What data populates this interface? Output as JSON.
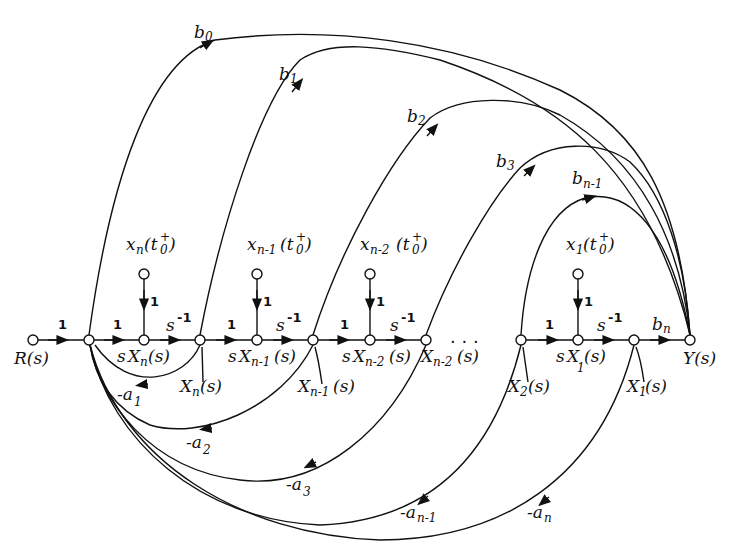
{
  "diagram": {
    "type": "signal-flow-graph",
    "input_label": "R(s)",
    "output_label": "Y(s)",
    "forward_path": {
      "input_gain": "1",
      "nodes": [
        {
          "id": "R",
          "label": "R(s)"
        },
        {
          "id": "N1",
          "label": ""
        },
        {
          "id": "sXn",
          "label": "sX_n(s)"
        },
        {
          "id": "Xn",
          "label": "X_n(s)"
        },
        {
          "id": "sXn1",
          "label": "sX_{n-1}(s)"
        },
        {
          "id": "Xn1",
          "label": "X_{n-1}(s)"
        },
        {
          "id": "sXn2",
          "label": "sX_{n-2}(s)"
        },
        {
          "id": "Xn2",
          "label": "X_{n-2}(s)"
        },
        {
          "id": "X2",
          "label": "X_2(s)"
        },
        {
          "id": "sX1",
          "label": "sX_1(s)"
        },
        {
          "id": "X1",
          "label": "X_1(s)"
        },
        {
          "id": "Y",
          "label": "Y(s)"
        }
      ],
      "branch_gains": [
        "1",
        "1",
        "s^-1",
        "1",
        "s^-1",
        "1",
        "s^-1",
        "...",
        "1",
        "s^-1",
        "b_n"
      ],
      "ellipsis": ". . ."
    },
    "initial_conditions": [
      {
        "label": "x_n(t_0^+)",
        "gain": "1",
        "target": "sX_n(s)"
      },
      {
        "label": "x_{n-1}(t_0^+)",
        "gain": "1",
        "target": "sX_{n-1}(s)"
      },
      {
        "label": "x_{n-2}(t_0^+)",
        "gain": "1",
        "target": "sX_{n-2}(s)"
      },
      {
        "label": "x_1(t_0^+)",
        "gain": "1",
        "target": "sX_1(s)"
      }
    ],
    "feedforward_gains": [
      "b0",
      "b1",
      "b2",
      "b3",
      "bn-1"
    ],
    "feedback_gains": [
      "-a1",
      "-a2",
      "-a3",
      "-an-1",
      "-an"
    ]
  },
  "labels": {
    "b0": {
      "base": "b",
      "sub": "0"
    },
    "b1": {
      "base": "b",
      "sub": "1"
    },
    "b2": {
      "base": "b",
      "sub": "2"
    },
    "b3": {
      "base": "b",
      "sub": "3"
    },
    "bn1": {
      "base": "b",
      "sub": "n-1"
    },
    "bn": {
      "base": "b",
      "sub": "n"
    },
    "a1": {
      "base": "-a",
      "sub": "1"
    },
    "a2": {
      "base": "-a",
      "sub": "2"
    },
    "a3": {
      "base": "-a",
      "sub": "3"
    },
    "an1": {
      "base": "-a",
      "sub": "n-1"
    },
    "an": {
      "base": "-a",
      "sub": "n"
    },
    "one": "1",
    "s": "s",
    "sinv_exp": "-1",
    "R": "R(s)",
    "Y": "Y(s)",
    "X": "X",
    "x": "x",
    "paren_s": "(s)",
    "n": "n",
    "n1": "n-1",
    "n2": "n-2",
    "sub1": "1",
    "sub2": "2",
    "ic_open": "(t",
    "ic_sub": "0",
    "ic_sup": "+",
    "ic_close": ")",
    "dots": ". . ."
  }
}
